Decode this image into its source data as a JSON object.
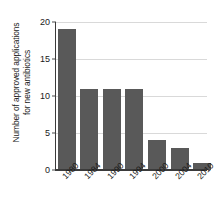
{
  "chart_data": {
    "type": "bar",
    "title": "",
    "subtitle": "",
    "xlabel": "",
    "ylabel_lines": [
      "Number of approved applications",
      "for new antibiotics"
    ],
    "ylabel": "Number of approved applications for new antibiotics",
    "categories": [
      "1980",
      "1984",
      "1990",
      "1994",
      "2000",
      "2004",
      "2010"
    ],
    "values": [
      19,
      11,
      11,
      11,
      4,
      3,
      1
    ],
    "ylim": [
      0,
      20
    ],
    "yticks": [
      0,
      5,
      10,
      15,
      20
    ],
    "ytick_labels": [
      "0",
      "5",
      "10",
      "15",
      "20"
    ],
    "grid": true,
    "grid_axis": "y",
    "legend": false,
    "legend_position": "none",
    "xtick_rotation": -45,
    "colors": {
      "bar": "#595959",
      "gridline": "#d9d9d9",
      "axis": "#3b3b3b",
      "text": "#1a1a1a",
      "background": "#ffffff"
    }
  }
}
